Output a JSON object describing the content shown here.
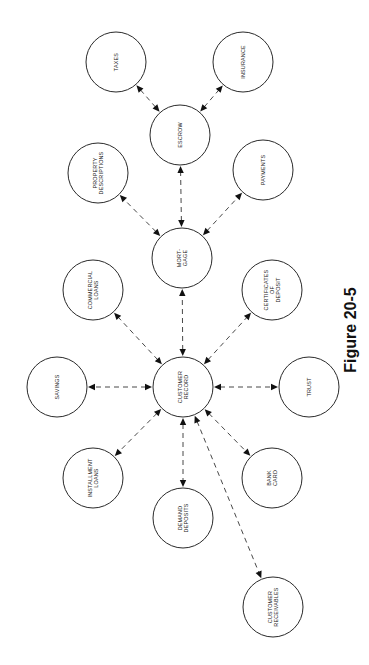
{
  "figure": {
    "caption": "Figure 20-5",
    "orientation": "rotated -90deg"
  },
  "nodes": [
    {
      "id": "customer_record",
      "label": [
        "CUSTOMER",
        "RECORD"
      ],
      "cx": 183,
      "cy": 387
    },
    {
      "id": "mortgage",
      "label": [
        "MORT-",
        "GAGE"
      ],
      "cx": 182,
      "cy": 258
    },
    {
      "id": "escrow",
      "label": [
        "ESCROW"
      ],
      "cx": 180,
      "cy": 135
    },
    {
      "id": "taxes",
      "label": [
        "TAXES"
      ],
      "cx": 116,
      "cy": 62
    },
    {
      "id": "insurance",
      "label": [
        "INSURANCE"
      ],
      "cx": 243,
      "cy": 62
    },
    {
      "id": "property_descriptions",
      "label": [
        "PROPERTY",
        "DESCRIPTIONS"
      ],
      "cx": 98,
      "cy": 173
    },
    {
      "id": "payments",
      "label": [
        "PAYMENTS"
      ],
      "cx": 263,
      "cy": 170
    },
    {
      "id": "commercial_loans",
      "label": [
        "COMMERCIAL",
        "LOANS"
      ],
      "cx": 93,
      "cy": 290
    },
    {
      "id": "certificates_of_deposit",
      "label": [
        "CERTIFICATES",
        "OF",
        "DEPOSIT"
      ],
      "cx": 272,
      "cy": 290
    },
    {
      "id": "savings",
      "label": [
        "SAVINGS"
      ],
      "cx": 57,
      "cy": 387
    },
    {
      "id": "trust",
      "label": [
        "TRUST"
      ],
      "cx": 309,
      "cy": 387
    },
    {
      "id": "installment_loans",
      "label": [
        "INSTALLMENT",
        "LOANS"
      ],
      "cx": 93,
      "cy": 478
    },
    {
      "id": "demand_deposits",
      "label": [
        "DEMAND",
        "DEPOSITS"
      ],
      "cx": 183,
      "cy": 518
    },
    {
      "id": "bank_card",
      "label": [
        "BANK",
        "CARD"
      ],
      "cx": 272,
      "cy": 478
    },
    {
      "id": "customer_receivables",
      "label": [
        "CUSTOMER",
        "RECEIVABLES"
      ],
      "cx": 273,
      "cy": 607
    }
  ],
  "edges": [
    {
      "from": "escrow",
      "to": "taxes",
      "style": "dashed",
      "arrows": "both"
    },
    {
      "from": "escrow",
      "to": "insurance",
      "style": "dashed",
      "arrows": "both"
    },
    {
      "from": "mortgage",
      "to": "escrow",
      "style": "dashed",
      "arrows": "both"
    },
    {
      "from": "mortgage",
      "to": "property_descriptions",
      "style": "dashed",
      "arrows": "both"
    },
    {
      "from": "mortgage",
      "to": "payments",
      "style": "dashed",
      "arrows": "both"
    },
    {
      "from": "customer_record",
      "to": "mortgage",
      "style": "dashed",
      "arrows": "both"
    },
    {
      "from": "customer_record",
      "to": "commercial_loans",
      "style": "dashed",
      "arrows": "both"
    },
    {
      "from": "customer_record",
      "to": "certificates_of_deposit",
      "style": "dashed",
      "arrows": "both"
    },
    {
      "from": "customer_record",
      "to": "savings",
      "style": "dashed",
      "arrows": "both"
    },
    {
      "from": "customer_record",
      "to": "trust",
      "style": "dashed",
      "arrows": "both"
    },
    {
      "from": "customer_record",
      "to": "installment_loans",
      "style": "dashed",
      "arrows": "both"
    },
    {
      "from": "customer_record",
      "to": "demand_deposits",
      "style": "dashed",
      "arrows": "both"
    },
    {
      "from": "customer_record",
      "to": "bank_card",
      "style": "dashed",
      "arrows": "both"
    },
    {
      "from": "customer_record",
      "to": "customer_receivables",
      "style": "dashed",
      "arrows": "both"
    }
  ],
  "style": {
    "node_radius": 30,
    "stroke_color": "#2a2a2a",
    "background": "#ffffff"
  }
}
